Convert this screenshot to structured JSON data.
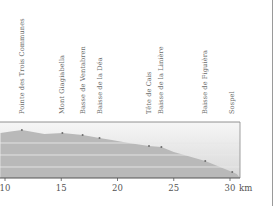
{
  "chart_data": {
    "type": "area",
    "title": "",
    "xlabel": "km",
    "ylabel": "",
    "xlim": [
      9.6,
      30.6
    ],
    "x_ticks": [
      10,
      15,
      20,
      25,
      30
    ],
    "x_tick_labels": [
      "10",
      "15",
      "20",
      "25",
      "30"
    ],
    "unit_label": "km",
    "grid": true,
    "legend": null,
    "colors": {
      "fill": "#b9b9b9",
      "sky_top": "#f4f4f4",
      "sky_bottom": "#dadada",
      "grid": "#e8e8e8",
      "axis": "#555555",
      "marker": "#6e6e6e"
    },
    "profile": {
      "x": [
        9.6,
        10.5,
        11.5,
        12.5,
        13.5,
        15.1,
        16.9,
        18.4,
        19.5,
        21.0,
        22.8,
        23.9,
        25.0,
        27.8,
        30.2,
        30.6
      ],
      "y_px": [
        133,
        131.5,
        130,
        132,
        134,
        133,
        135,
        138,
        140,
        143,
        146,
        147,
        152,
        161,
        172,
        174
      ]
    },
    "waypoints": [
      {
        "name": "Pointe des Trois Communes",
        "km": 11.5
      },
      {
        "name": "Mont Giagiabella",
        "km": 15.1
      },
      {
        "name": "Basse de Ventabren",
        "km": 16.9
      },
      {
        "name": "Baisse de la Déa",
        "km": 18.4
      },
      {
        "name": "Tête de Cais",
        "km": 22.8
      },
      {
        "name": "Baisse de la Linière",
        "km": 23.9
      },
      {
        "name": "Baisse de Figuièra",
        "km": 27.8
      },
      {
        "name": "Sospel",
        "km": 30.2
      }
    ]
  }
}
